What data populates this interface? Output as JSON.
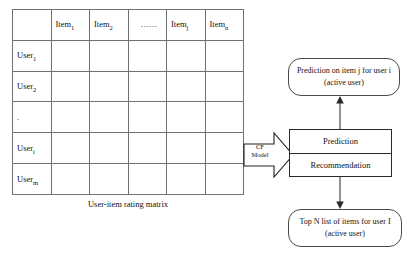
{
  "matrix": {
    "caption": "User-item rating matrix",
    "corner_label": "",
    "column_headers": [
      {
        "base": "Item",
        "sub": "1",
        "kind": "item"
      },
      {
        "base": "Item",
        "sub": "2",
        "kind": "item"
      },
      {
        "base": "......",
        "sub": "",
        "kind": "ellipsis"
      },
      {
        "base": "Item",
        "sub": "j",
        "kind": "item"
      },
      {
        "base": "Item",
        "sub": "n",
        "kind": "item"
      }
    ],
    "row_headers": [
      {
        "base": "User",
        "sub": "1",
        "kind": "user"
      },
      {
        "base": "User",
        "sub": "2",
        "kind": "user"
      },
      {
        "base": ".",
        "sub": "",
        "kind": "dot"
      },
      {
        "base": "User",
        "sub": "i",
        "kind": "user"
      },
      {
        "base": "User",
        "sub": "m",
        "kind": "user"
      }
    ],
    "highlighted_row_index": 3,
    "highlighted_column_index": 3
  },
  "cf_model": {
    "line1": "CF",
    "line2": "Model"
  },
  "boxes": {
    "prediction_top": "Prediction on item j for user i (active user)",
    "prediction_label": "Prediction",
    "recommendation_label": "Recommendation",
    "top_n": "Top N list of items for user I (active user)"
  },
  "colors": {
    "highlight_row": "#4d4d4d",
    "highlight_cell": "#1c1c1c",
    "column_tint": "#f4f4f4",
    "line": "#4a4a4a",
    "background": "#ffffff"
  }
}
